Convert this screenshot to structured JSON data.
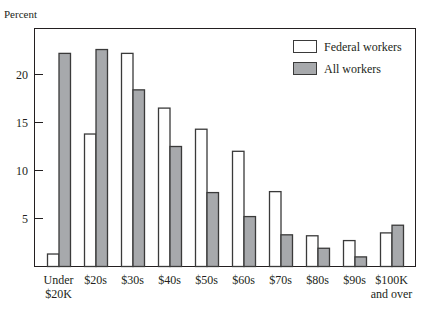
{
  "chart_data": {
    "type": "bar",
    "title": "",
    "xlabel": "",
    "ylabel": "Percent",
    "ylim": [
      0,
      23
    ],
    "yticks": [
      5,
      10,
      15,
      20
    ],
    "grid": false,
    "legend_position": "upper right, inside",
    "categories": [
      [
        "Under",
        "$20K"
      ],
      [
        "$20s"
      ],
      [
        "$30s"
      ],
      [
        "$40s"
      ],
      [
        "$50s"
      ],
      [
        "$60s"
      ],
      [
        "$70s"
      ],
      [
        "$80s"
      ],
      [
        "$90s"
      ],
      [
        "$100K",
        "and over"
      ]
    ],
    "series": [
      {
        "name": "Federal workers",
        "color": "#ffffff",
        "values": [
          1.3,
          13.8,
          22.2,
          16.5,
          14.3,
          12.0,
          7.8,
          3.2,
          2.7,
          3.5
        ]
      },
      {
        "name": "All workers",
        "color": "#a7a9ac",
        "values": [
          22.2,
          22.6,
          18.4,
          12.5,
          7.7,
          5.2,
          3.3,
          1.9,
          1.0,
          4.3
        ]
      }
    ]
  },
  "colors": {
    "stroke": "#3a3a3a",
    "federal": "#ffffff",
    "all": "#a7a9ac"
  }
}
